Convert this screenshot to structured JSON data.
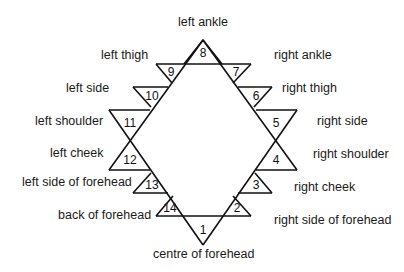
{
  "diagram": {
    "nodes": [
      {
        "n": "1",
        "label": "centre of forehead"
      },
      {
        "n": "2",
        "label": "right side of forehead"
      },
      {
        "n": "3",
        "label": "right cheek"
      },
      {
        "n": "4",
        "label": "right shoulder"
      },
      {
        "n": "5",
        "label": "right side"
      },
      {
        "n": "6",
        "label": "right thigh"
      },
      {
        "n": "7",
        "label": "right ankle"
      },
      {
        "n": "8",
        "label": "left ankle"
      },
      {
        "n": "9",
        "label": "left thigh"
      },
      {
        "n": "10",
        "label": "left side"
      },
      {
        "n": "11",
        "label": "left shoulder"
      },
      {
        "n": "12",
        "label": "left cheek"
      },
      {
        "n": "13",
        "label": "left side of forehead"
      },
      {
        "n": "14",
        "label": "back of forehead"
      }
    ],
    "line_color": "#111111"
  }
}
